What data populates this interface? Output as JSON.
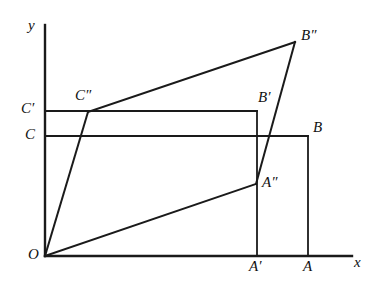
{
  "figure": {
    "type": "geometry-diagram",
    "background_color": "#ffffff",
    "stroke_color": "#1a1a1a",
    "width": 381,
    "height": 289,
    "axes": {
      "x_label": "x",
      "y_label": "y",
      "origin_label": "O"
    },
    "points": [
      {
        "key": "O",
        "label": "O",
        "x": 45,
        "y": 256,
        "label_x": 28,
        "label_y": 247
      },
      {
        "key": "A",
        "label": "A",
        "x": 308,
        "y": 256,
        "label_x": 303,
        "label_y": 259
      },
      {
        "key": "Ap",
        "label": "A′",
        "x": 257,
        "y": 256,
        "label_x": 249,
        "label_y": 259
      },
      {
        "key": "App",
        "label": "A″",
        "x": 256,
        "y": 184,
        "label_x": 262,
        "label_y": 175
      },
      {
        "key": "B",
        "label": "B",
        "x": 308,
        "y": 136,
        "label_x": 313,
        "label_y": 120
      },
      {
        "key": "Bp",
        "label": "B′",
        "x": 257,
        "y": 111,
        "label_x": 258,
        "label_y": 90
      },
      {
        "key": "Bpp",
        "label": "B″",
        "x": 295,
        "y": 42,
        "label_x": 301,
        "label_y": 28
      },
      {
        "key": "C",
        "label": "C",
        "x": 45,
        "y": 136,
        "label_x": 25,
        "label_y": 127
      },
      {
        "key": "Cp",
        "label": "C′",
        "x": 45,
        "y": 111,
        "label_x": 21,
        "label_y": 101
      },
      {
        "key": "Cpp",
        "label": "C″",
        "x": 88,
        "y": 112,
        "label_x": 75,
        "label_y": 88
      },
      {
        "key": "x",
        "label": "x",
        "x": 357,
        "y": 262,
        "label_x": 354,
        "label_y": 255
      },
      {
        "key": "y",
        "label": "y",
        "x": 45,
        "y": 22,
        "label_x": 28,
        "label_y": 18
      }
    ],
    "segments": [
      {
        "name": "y-axis",
        "x1": 45,
        "y1": 25,
        "x2": 45,
        "y2": 256,
        "width": 2.4
      },
      {
        "name": "x-axis",
        "x1": 45,
        "y1": 256,
        "x2": 352,
        "y2": 256,
        "width": 2.4
      },
      {
        "name": "rect-OABC-top",
        "x1": 45,
        "y1": 136,
        "x2": 308,
        "y2": 136,
        "width": 1.8
      },
      {
        "name": "rect-OABC-right",
        "x1": 308,
        "y1": 136,
        "x2": 308,
        "y2": 256,
        "width": 1.8
      },
      {
        "name": "rect-OApBpCp-top",
        "x1": 45,
        "y1": 111,
        "x2": 257,
        "y2": 111,
        "width": 1.8
      },
      {
        "name": "rect-OApBpCp-right",
        "x1": 257,
        "y1": 111,
        "x2": 257,
        "y2": 256,
        "width": 1.8
      },
      {
        "name": "segment-O-Cpp",
        "x1": 45,
        "y1": 256,
        "x2": 88,
        "y2": 112,
        "width": 2.0
      },
      {
        "name": "segment-O-App",
        "x1": 45,
        "y1": 256,
        "x2": 256,
        "y2": 184,
        "width": 2.0
      },
      {
        "name": "segment-Cpp-Bpp",
        "x1": 88,
        "y1": 112,
        "x2": 295,
        "y2": 42,
        "width": 2.0
      },
      {
        "name": "segment-Bpp-App",
        "x1": 295,
        "y1": 42,
        "x2": 256,
        "y2": 184,
        "width": 2.0
      }
    ]
  }
}
